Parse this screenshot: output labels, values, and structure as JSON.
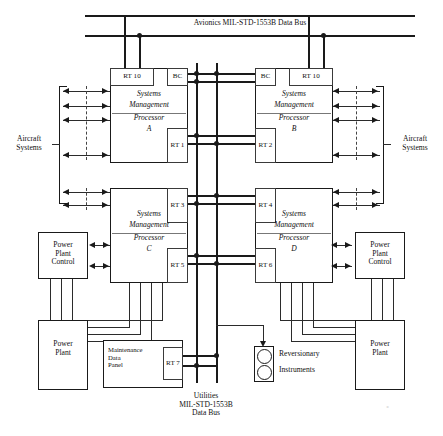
{
  "diagram": {
    "buses": {
      "avionics": {
        "label": "Avionics MIL-STD-1553B Data Bus"
      },
      "utilities": {
        "label": "Utilities\nMIL-STD-1553B\nData Bus"
      }
    },
    "processors": [
      {
        "id": "A",
        "line1": "Systems",
        "line2": "Management",
        "line3": "Processor",
        "line4": "A",
        "terminals": [
          {
            "name": "RT 10"
          },
          {
            "name": "BC"
          },
          {
            "name": "RT\n1"
          }
        ]
      },
      {
        "id": "B",
        "line1": "Systems",
        "line2": "Management",
        "line3": "Processor",
        "line4": "B",
        "terminals": [
          {
            "name": "BC"
          },
          {
            "name": "RT 10"
          },
          {
            "name": "RT\n2"
          }
        ]
      },
      {
        "id": "C",
        "line1": "Systems",
        "line2": "Management",
        "line3": "Processor",
        "line4": "C",
        "terminals": [
          {
            "name": "RT\n3"
          },
          {
            "name": "RT\n5"
          }
        ]
      },
      {
        "id": "D",
        "line1": "Systems",
        "line2": "Management",
        "line3": "Processor",
        "line4": "D",
        "terminals": [
          {
            "name": "RT\n4"
          },
          {
            "name": "RT\n6"
          }
        ]
      }
    ],
    "aircraft_systems_left": {
      "label": "Aircraft\nSystems"
    },
    "aircraft_systems_right": {
      "label": "Aircraft\nSystems"
    },
    "power_plant_control_left": {
      "label": "Power\nPlant\nControl"
    },
    "power_plant_control_right": {
      "label": "Power\nPlant\nControl"
    },
    "power_plant_left": {
      "label": "Power\nPlant"
    },
    "power_plant_right": {
      "label": "Power\nPlant"
    },
    "maintenance_panel": {
      "label": "Maintenance\nData\nPanel",
      "terminal": "RT\n7"
    },
    "reversionary": {
      "line1": "Reversionary",
      "line2": "Instruments"
    },
    "colors": {
      "line": "#1a1a1a",
      "subline": "#3a3a3a",
      "background": "#ffffff"
    }
  }
}
